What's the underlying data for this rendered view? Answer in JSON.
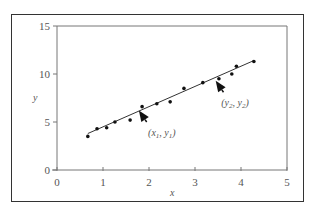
{
  "chart_data": {
    "type": "scatter",
    "title": "",
    "xlabel": "x",
    "ylabel": "y",
    "xlim": [
      0,
      5
    ],
    "ylim": [
      0,
      15
    ],
    "x_ticks": [
      "0",
      "1",
      "2",
      "3",
      "4",
      "5"
    ],
    "y_ticks": [
      "0",
      "5",
      "10",
      "15"
    ],
    "grid": false,
    "legend": null,
    "series": [
      {
        "name": "data points",
        "type": "scatter",
        "x": [
          0.67,
          0.87,
          1.08,
          1.26,
          1.59,
          1.85,
          2.17,
          2.46,
          2.76,
          3.17,
          3.52,
          3.8,
          3.9,
          4.28
        ],
        "y": [
          3.5,
          4.3,
          4.4,
          5.0,
          5.2,
          6.6,
          6.9,
          7.1,
          8.5,
          9.1,
          9.5,
          10.0,
          10.8,
          11.3
        ]
      },
      {
        "name": "fitted line",
        "type": "line",
        "x": [
          0.67,
          4.28
        ],
        "y": [
          3.8,
          11.4
        ]
      }
    ],
    "annotations": [
      {
        "text": "(x1, y1)",
        "label_main": "(x",
        "sub1": "1",
        "mid": ", y",
        "sub2": "1",
        "end": ")",
        "arrow_tip": [
          1.78,
          6.2
        ],
        "arrow_tail": [
          1.95,
          5.0
        ],
        "label_pos": [
          1.98,
          3.5
        ]
      },
      {
        "text": "(x2, y2)",
        "label_main": "(y",
        "sub1": "2",
        "mid": ", y",
        "sub2": "2",
        "end": ")",
        "arrow_tip": [
          3.45,
          9.3
        ],
        "arrow_tail": [
          3.62,
          8.1
        ],
        "label_pos": [
          3.57,
          6.7
        ]
      }
    ]
  },
  "colors": {
    "axis": "#777777",
    "frame": "#333333",
    "points": "#111111",
    "line": "#333333",
    "text": "#555555"
  }
}
